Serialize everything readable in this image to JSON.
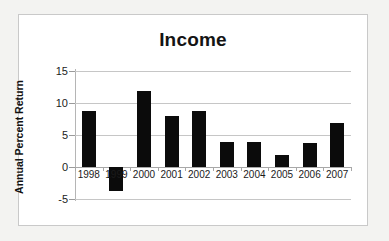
{
  "figure": {
    "background_color": "#ffffff",
    "border_color": "#c9c9c9",
    "page_background": "#f3f3f1"
  },
  "chart_data": {
    "type": "bar",
    "title": "Income",
    "xlabel": "",
    "ylabel": "Annual Percent Return",
    "categories": [
      "1998",
      "1999",
      "2000",
      "2001",
      "2002",
      "2003",
      "2004",
      "2005",
      "2006",
      "2007"
    ],
    "values": [
      8.8,
      -3.8,
      11.9,
      7.9,
      8.8,
      3.9,
      3.9,
      1.8,
      3.8,
      6.8
    ],
    "ylim": [
      -5,
      15
    ],
    "yticks": [
      15,
      10,
      5,
      0,
      -5
    ],
    "ytick_labels": [
      "15",
      "10",
      "5",
      "0",
      "-5"
    ],
    "grid": true,
    "grid_axis": "y",
    "legend": false,
    "bar_color": "#0b0b0b",
    "gridline_color": "#c6c6c6",
    "axis_color": "#a8a8a8"
  }
}
